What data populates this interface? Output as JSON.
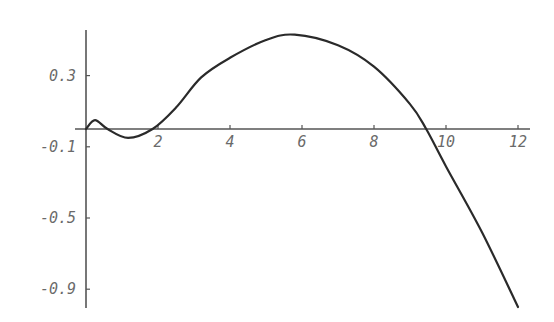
{
  "chart_data": {
    "type": "line",
    "title": "",
    "xlabel": "",
    "ylabel": "",
    "xlim": [
      0,
      12.3
    ],
    "ylim": [
      -1.0,
      0.55
    ],
    "grid": false,
    "legend": null,
    "x_ticks": [
      2,
      4,
      6,
      8,
      10,
      12
    ],
    "x_tick_labels": [
      "2",
      "4",
      "6",
      "8",
      "10",
      "12"
    ],
    "y_ticks": [
      0.3,
      -0.1,
      -0.5,
      -0.9
    ],
    "y_tick_labels": [
      "0.3",
      "-0.1",
      "-0.5",
      "-0.9"
    ],
    "series": [
      {
        "name": "f(x)",
        "x": [
          0,
          0.25,
          0.6,
          1.17,
          1.85,
          2.5,
          3.2,
          4,
          5,
          5.8,
          7,
          8,
          9,
          9.45,
          10,
          11,
          12
        ],
        "values": [
          0.0,
          0.05,
          0.0,
          -0.05,
          0.0,
          0.12,
          0.29,
          0.4,
          0.5,
          0.53,
          0.47,
          0.35,
          0.14,
          0.0,
          -0.21,
          -0.58,
          -1.0
        ]
      }
    ]
  }
}
